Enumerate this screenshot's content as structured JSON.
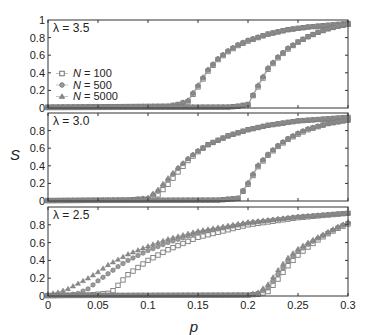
{
  "chart_data": {
    "type": "scatter",
    "xlabel": "p",
    "ylabel": "S",
    "xlim": [
      0,
      0.3
    ],
    "ylim": [
      0,
      1
    ],
    "x_ticks": [
      "0",
      "0.05",
      "0.1",
      "0.15",
      "0.2",
      "0.25",
      "0.3"
    ],
    "y_ticks": [
      "0",
      "0.2",
      "0.4",
      "0.6",
      "0.8",
      "1"
    ],
    "legend": {
      "position": "top panel, lower left",
      "entries": [
        {
          "label": "N = 100",
          "marker": "square-open"
        },
        {
          "label": "N = 500",
          "marker": "circle"
        },
        {
          "label": "N = 5000",
          "marker": "triangle"
        }
      ]
    },
    "panels": [
      {
        "label": "λ = 3.5",
        "series": [
          {
            "name": "N = 100 (upper branch)",
            "marker": "square-open",
            "x": [
              0,
              0.12,
              0.13,
              0.14,
              0.15,
              0.16,
              0.17,
              0.18,
              0.19,
              0.2,
              0.22,
              0.24,
              0.26,
              0.28,
              0.3
            ],
            "y": [
              0.01,
              0.02,
              0.04,
              0.07,
              0.24,
              0.42,
              0.55,
              0.64,
              0.71,
              0.76,
              0.84,
              0.89,
              0.92,
              0.94,
              0.96
            ]
          },
          {
            "name": "N = 500 (upper branch)",
            "marker": "circle",
            "x": [
              0,
              0.12,
              0.13,
              0.14,
              0.15,
              0.16,
              0.17,
              0.18,
              0.19,
              0.2,
              0.22,
              0.24,
              0.26,
              0.28,
              0.3
            ],
            "y": [
              0.01,
              0.02,
              0.04,
              0.08,
              0.25,
              0.43,
              0.56,
              0.65,
              0.72,
              0.77,
              0.84,
              0.89,
              0.92,
              0.94,
              0.96
            ]
          },
          {
            "name": "N = 5000 (upper branch)",
            "marker": "triangle",
            "x": [
              0,
              0.12,
              0.13,
              0.14,
              0.15,
              0.16,
              0.17,
              0.18,
              0.19,
              0.2,
              0.22,
              0.24,
              0.26,
              0.28,
              0.3
            ],
            "y": [
              0.01,
              0.02,
              0.04,
              0.09,
              0.26,
              0.44,
              0.56,
              0.65,
              0.72,
              0.77,
              0.84,
              0.89,
              0.92,
              0.94,
              0.96
            ]
          },
          {
            "name": "N = 100 (lower branch)",
            "marker": "square-open",
            "x": [
              0,
              0.18,
              0.19,
              0.2,
              0.21,
              0.22,
              0.23,
              0.24,
              0.25,
              0.26,
              0.27,
              0.28,
              0.29,
              0.3
            ],
            "y": [
              0.005,
              0.01,
              0.02,
              0.04,
              0.24,
              0.44,
              0.57,
              0.67,
              0.75,
              0.81,
              0.86,
              0.9,
              0.93,
              0.95
            ]
          },
          {
            "name": "N = 500 (lower branch)",
            "marker": "circle",
            "x": [
              0,
              0.18,
              0.19,
              0.2,
              0.21,
              0.22,
              0.23,
              0.24,
              0.25,
              0.26,
              0.27,
              0.28,
              0.29,
              0.3
            ],
            "y": [
              0.005,
              0.01,
              0.02,
              0.04,
              0.25,
              0.45,
              0.58,
              0.68,
              0.75,
              0.81,
              0.86,
              0.9,
              0.93,
              0.95
            ]
          },
          {
            "name": "N = 5000 (lower branch)",
            "marker": "triangle",
            "x": [
              0,
              0.18,
              0.19,
              0.2,
              0.21,
              0.22,
              0.23,
              0.24,
              0.25,
              0.26,
              0.27,
              0.28,
              0.29,
              0.3
            ],
            "y": [
              0.005,
              0.01,
              0.02,
              0.04,
              0.26,
              0.46,
              0.58,
              0.68,
              0.75,
              0.81,
              0.86,
              0.9,
              0.93,
              0.95
            ]
          }
        ]
      },
      {
        "label": "λ = 3.0",
        "series": [
          {
            "name": "N = 100 (upper branch)",
            "marker": "square-open",
            "x": [
              0,
              0.08,
              0.09,
              0.1,
              0.11,
              0.12,
              0.13,
              0.14,
              0.15,
              0.16,
              0.18,
              0.2,
              0.22,
              0.25,
              0.3
            ],
            "y": [
              0.005,
              0.01,
              0.02,
              0.02,
              0.07,
              0.19,
              0.33,
              0.46,
              0.56,
              0.64,
              0.74,
              0.81,
              0.86,
              0.91,
              0.95
            ]
          },
          {
            "name": "N = 500 (upper branch)",
            "marker": "circle",
            "x": [
              0,
              0.08,
              0.09,
              0.1,
              0.11,
              0.12,
              0.13,
              0.14,
              0.15,
              0.16,
              0.18,
              0.2,
              0.22,
              0.25,
              0.3
            ],
            "y": [
              0.005,
              0.01,
              0.02,
              0.03,
              0.11,
              0.24,
              0.37,
              0.48,
              0.57,
              0.64,
              0.74,
              0.81,
              0.86,
              0.91,
              0.95
            ]
          },
          {
            "name": "N = 5000 (upper branch)",
            "marker": "triangle",
            "x": [
              0,
              0.08,
              0.09,
              0.1,
              0.11,
              0.12,
              0.13,
              0.14,
              0.15,
              0.16,
              0.18,
              0.2,
              0.22,
              0.25,
              0.3
            ],
            "y": [
              0.005,
              0.01,
              0.02,
              0.04,
              0.13,
              0.26,
              0.38,
              0.48,
              0.57,
              0.64,
              0.74,
              0.81,
              0.86,
              0.91,
              0.95
            ]
          },
          {
            "name": "N = 100 (lower branch)",
            "marker": "square-open",
            "x": [
              0,
              0.17,
              0.18,
              0.19,
              0.2,
              0.21,
              0.22,
              0.23,
              0.24,
              0.25,
              0.26,
              0.28,
              0.3
            ],
            "y": [
              0.005,
              0.01,
              0.02,
              0.03,
              0.19,
              0.39,
              0.52,
              0.62,
              0.7,
              0.76,
              0.81,
              0.88,
              0.92
            ]
          },
          {
            "name": "N = 500 (lower branch)",
            "marker": "circle",
            "x": [
              0,
              0.17,
              0.18,
              0.19,
              0.2,
              0.21,
              0.22,
              0.23,
              0.24,
              0.25,
              0.26,
              0.28,
              0.3
            ],
            "y": [
              0.005,
              0.01,
              0.02,
              0.03,
              0.2,
              0.4,
              0.53,
              0.63,
              0.71,
              0.77,
              0.82,
              0.88,
              0.92
            ]
          },
          {
            "name": "N = 5000 (lower branch)",
            "marker": "triangle",
            "x": [
              0,
              0.17,
              0.18,
              0.19,
              0.2,
              0.21,
              0.22,
              0.23,
              0.24,
              0.25,
              0.26,
              0.28,
              0.3
            ],
            "y": [
              0.005,
              0.01,
              0.02,
              0.03,
              0.21,
              0.41,
              0.53,
              0.63,
              0.71,
              0.77,
              0.82,
              0.88,
              0.92
            ]
          }
        ]
      },
      {
        "label": "λ = 2.5",
        "series": [
          {
            "name": "N = 100 (upper branch)",
            "marker": "square-open",
            "x": [
              0,
              0.04,
              0.05,
              0.06,
              0.065,
              0.07,
              0.08,
              0.09,
              0.1,
              0.12,
              0.15,
              0.2,
              0.25,
              0.3
            ],
            "y": [
              0.005,
              0.01,
              0.02,
              0.03,
              0.06,
              0.12,
              0.24,
              0.32,
              0.4,
              0.52,
              0.66,
              0.8,
              0.88,
              0.93
            ]
          },
          {
            "name": "N = 500 (upper branch)",
            "marker": "circle",
            "x": [
              0,
              0.02,
              0.03,
              0.04,
              0.05,
              0.06,
              0.07,
              0.08,
              0.1,
              0.12,
              0.15,
              0.2,
              0.25,
              0.3
            ],
            "y": [
              0.005,
              0.01,
              0.03,
              0.08,
              0.17,
              0.25,
              0.33,
              0.4,
              0.51,
              0.6,
              0.71,
              0.82,
              0.89,
              0.93
            ]
          },
          {
            "name": "N = 5000 (upper branch)",
            "marker": "triangle",
            "x": [
              0,
              0.01,
              0.02,
              0.03,
              0.04,
              0.05,
              0.06,
              0.07,
              0.08,
              0.1,
              0.12,
              0.15,
              0.2,
              0.25,
              0.3
            ],
            "y": [
              0.02,
              0.04,
              0.08,
              0.14,
              0.2,
              0.27,
              0.35,
              0.41,
              0.47,
              0.56,
              0.64,
              0.73,
              0.83,
              0.89,
              0.93
            ]
          },
          {
            "name": "N = 100 (lower branch)",
            "marker": "square-open",
            "x": [
              0,
              0.2,
              0.21,
              0.22,
              0.23,
              0.24,
              0.25,
              0.26,
              0.27,
              0.28,
              0.29,
              0.3
            ],
            "y": [
              0.005,
              0.01,
              0.02,
              0.05,
              0.19,
              0.34,
              0.46,
              0.55,
              0.63,
              0.7,
              0.76,
              0.81
            ]
          },
          {
            "name": "N = 500 (lower branch)",
            "marker": "circle",
            "x": [
              0,
              0.2,
              0.21,
              0.22,
              0.23,
              0.24,
              0.25,
              0.26,
              0.27,
              0.28,
              0.29,
              0.3
            ],
            "y": [
              0.005,
              0.01,
              0.03,
              0.09,
              0.24,
              0.39,
              0.5,
              0.58,
              0.65,
              0.71,
              0.77,
              0.82
            ]
          },
          {
            "name": "N = 5000 (lower branch)",
            "marker": "triangle",
            "x": [
              0,
              0.2,
              0.21,
              0.22,
              0.23,
              0.24,
              0.25,
              0.26,
              0.27,
              0.28,
              0.29,
              0.3
            ],
            "y": [
              0.005,
              0.01,
              0.04,
              0.13,
              0.29,
              0.43,
              0.53,
              0.6,
              0.66,
              0.72,
              0.78,
              0.83
            ]
          }
        ]
      }
    ]
  },
  "figure": {
    "xlabel": "p",
    "ylabel": "S",
    "panel_labels": [
      "λ = 3.5",
      "λ = 3.0",
      "λ = 2.5"
    ],
    "legend_labels": [
      "N = 100",
      "N = 500",
      "N = 5000"
    ],
    "marker_color": "#7a7a7a",
    "axis_color": "#333333"
  }
}
